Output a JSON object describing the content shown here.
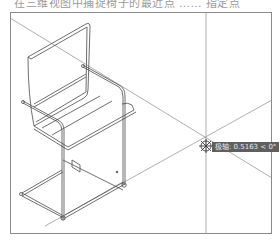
{
  "caption": {
    "text": "在三维视图中捕捉椅子的最近点 …… 指定点"
  },
  "viewport": {
    "border_color": "#8a8a8a",
    "line_color": "#7a7a7a"
  },
  "tooltip": {
    "text": "极轴: 0.5163 < 0°",
    "background": "#5f5f5f"
  },
  "cursor": {
    "icon": "crosshair-snap-icon"
  },
  "drawing": {
    "object": "chair-3d-wireframe"
  }
}
